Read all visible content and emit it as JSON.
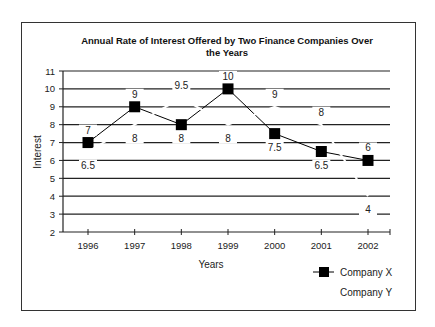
{
  "chart_data": {
    "type": "line",
    "title_lines": [
      "Annual Rate of Interest Offered by Two Finance Companies Over",
      "the Years"
    ],
    "title": "Annual Rate of Interest Offered by Two Finance Companies Over the Years",
    "xlabel": "Years",
    "ylabel": "Interest",
    "categories": [
      "1996",
      "1997",
      "1998",
      "1999",
      "2000",
      "2001",
      "2002"
    ],
    "ylim": [
      2,
      11
    ],
    "yticks": [
      2,
      3,
      4,
      5,
      6,
      7,
      8,
      9,
      10,
      11
    ],
    "grid": true,
    "legend_position": "bottom-right",
    "series": [
      {
        "name": "Company X",
        "values": [
          7,
          9,
          8,
          10,
          7.5,
          6.5,
          6
        ],
        "labels": [
          "7",
          "9",
          "8",
          "10",
          "7.5",
          "6.5",
          "6"
        ],
        "label_positions": [
          "above",
          "above",
          "below",
          "above",
          "below",
          "below",
          "above"
        ],
        "color": "#000000",
        "marker": "square"
      },
      {
        "name": "Company Y",
        "values": [
          6.5,
          8,
          9.5,
          8,
          9,
          8,
          4
        ],
        "labels": [
          "6.5",
          "8",
          "9.5",
          "8",
          "9",
          "8",
          "4"
        ],
        "label_positions": [
          "below",
          "below",
          "above",
          "below",
          "above",
          "above",
          "below"
        ],
        "color": "#ffffff",
        "marker": "none"
      }
    ]
  }
}
